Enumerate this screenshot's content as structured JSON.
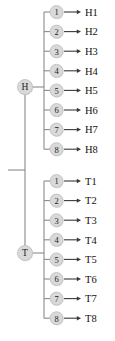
{
  "diagram": {
    "type": "tree",
    "title": "",
    "root": {
      "label": "",
      "name": "root-stub"
    },
    "branches": [
      {
        "label": "H",
        "name": "branch-h",
        "nodes": [
          {
            "number": "1",
            "outcome": "H1"
          },
          {
            "number": "2",
            "outcome": "H2"
          },
          {
            "number": "3",
            "outcome": "H3"
          },
          {
            "number": "4",
            "outcome": "H4"
          },
          {
            "number": "5",
            "outcome": "H5"
          },
          {
            "number": "6",
            "outcome": "H6"
          },
          {
            "number": "7",
            "outcome": "H7"
          },
          {
            "number": "8",
            "outcome": "H8"
          }
        ]
      },
      {
        "label": "T",
        "name": "branch-t",
        "nodes": [
          {
            "number": "1",
            "outcome": "T1"
          },
          {
            "number": "2",
            "outcome": "T2"
          },
          {
            "number": "3",
            "outcome": "T3"
          },
          {
            "number": "4",
            "outcome": "T4"
          },
          {
            "number": "5",
            "outcome": "T5"
          },
          {
            "number": "6",
            "outcome": "T6"
          },
          {
            "number": "7",
            "outcome": "T7"
          },
          {
            "number": "8",
            "outcome": "T8"
          }
        ]
      }
    ],
    "colors": {
      "node_fill": "#d9d9d9",
      "node_stroke": "#bdbdbd",
      "edge": "#8a8a8a",
      "arrow": "#3a3a3a",
      "text": "#111111",
      "background": "#ffffff"
    },
    "geometry": {
      "root_x": 8,
      "trunk_x": 25,
      "root_y": 170,
      "branch_bar_x": 44,
      "node_x": 56.5,
      "node_r": 6.5,
      "branch_r": 7.5,
      "arrow_start_x": 64,
      "arrow_end_x": 81,
      "label_x": 85,
      "h_first_y": 12,
      "t_first_y": 181,
      "row_gap": 19.6,
      "h_center_y": 87,
      "t_center_y": 253
    }
  }
}
